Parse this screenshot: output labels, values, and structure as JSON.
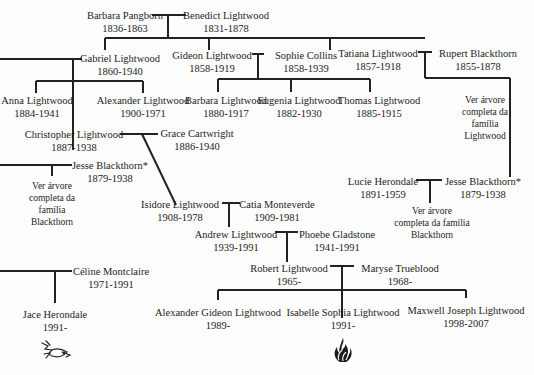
{
  "tree": {
    "generation_1": {
      "barbara_pangborn": {
        "name": "Barbara Pangborn",
        "years": "1836-1863"
      },
      "benedict_lightwood": {
        "name": "Benedict Lightwood",
        "years": "1831-1878"
      }
    },
    "generation_2": {
      "gabriel_lightwood": {
        "name": "Gabriel Lightwood",
        "years": "1860-1940"
      },
      "gideon_lightwood": {
        "name": "Gideon Lightwood",
        "years": "1858-1919"
      },
      "sophie_collins": {
        "name": "Sophie Collins",
        "years": "1858-1939"
      },
      "tatiana_lightwood": {
        "name": "Tatiana Lightwood",
        "years": "1857-1918"
      },
      "rupert_blackthorn": {
        "name": "Rupert Blackthorn",
        "years": "1855-1878"
      }
    },
    "generation_3": {
      "anna_lightwood": {
        "name": "Anna Lightwood",
        "years": "1884-1941"
      },
      "alexander_lightwood": {
        "name": "Alexander Lightwood",
        "years": "1900-1971"
      },
      "barbara_lightwood": {
        "name": "Barbara Lightwood",
        "years": "1880-1917"
      },
      "eugenia_lightwood": {
        "name": "Eugenia Lightwood",
        "years": "1882-1930"
      },
      "thomas_lightwood": {
        "name": "Thomas Lightwood",
        "years": "1885-1915"
      },
      "christopher_lightwood": {
        "name": "Christopher Lightwood",
        "years": "1887-1938"
      },
      "grace_cartwright": {
        "name": "Grace Cartwright",
        "years": "1886-1940"
      },
      "jesse_blackthorn_left": {
        "name": "Jesse Blackthorn*",
        "years": "1879-1938"
      },
      "jesse_blackthorn_right": {
        "name": "Jesse Blackthorn*",
        "years": "1879-1938"
      },
      "lucie_herondale": {
        "name": "Lucie Herondale",
        "years": "1891-1959"
      }
    },
    "generation_4": {
      "isidore_lightwood": {
        "name": "Isidore Lightwood",
        "years": "1908-1978"
      },
      "catia_monteverde": {
        "name": "Catia Monteverde",
        "years": "1909-1981"
      }
    },
    "generation_5": {
      "andrew_lightwood": {
        "name": "Andrew Lightwood",
        "years": "1939-1991"
      },
      "phoebe_gladstone": {
        "name": "Phoebe Gladstone",
        "years": "1941-1991"
      }
    },
    "generation_6": {
      "robert_lightwood": {
        "name": "Robert Lightwood",
        "years": "1965-"
      },
      "maryse_trueblood": {
        "name": "Maryse Trueblood",
        "years": "1968-"
      },
      "celine_montclaire": {
        "name": "Céline Montclaire",
        "years": "1971-1991"
      }
    },
    "generation_7": {
      "alexander_gideon_lightwood": {
        "name": "Alexander Gideon Lightwood",
        "years": "1989-"
      },
      "isabelle_sophia_lightwood": {
        "name": "Isabelle Sophia Lightwood",
        "years": "1991-"
      },
      "maxwell_joseph_lightwood": {
        "name": "Maxwell Joseph Lightwood",
        "years": "1998-2007"
      },
      "jace_herondale": {
        "name": "Jace Herondale",
        "years": "1991-"
      }
    }
  },
  "notes": {
    "lightwood_tree": [
      "Ver árvore",
      "completa da",
      "família",
      "Lightwood"
    ],
    "blackthorn_tree_left": [
      "Ver árvore",
      "completa da",
      "família",
      "Blackthorn"
    ],
    "blackthorn_tree_right": [
      "Ver árvore",
      "completa da família",
      "Blackthorn"
    ]
  },
  "emblems": {
    "herondale": "bird-icon",
    "lightwood": "flame-icon"
  }
}
